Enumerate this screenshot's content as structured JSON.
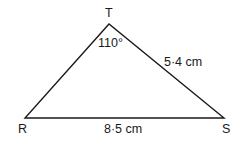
{
  "diagram": {
    "type": "triangle",
    "vertices": {
      "T": {
        "label": "T",
        "x": 109,
        "y": 24
      },
      "R": {
        "label": "R",
        "x": 25,
        "y": 118
      },
      "S": {
        "label": "S",
        "x": 224,
        "y": 118
      }
    },
    "angle_T": "110°",
    "side_TS": "5·4 cm",
    "side_RS": "8·5 cm",
    "stroke_color": "#1a1a1a",
    "background_color": "#ffffff"
  }
}
